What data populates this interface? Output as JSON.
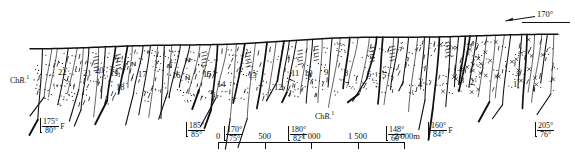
{
  "figure": {
    "type": "geological-cross-section",
    "title": "",
    "heading_annotation": {
      "label": "170°",
      "icon": "left-arrow-icon"
    },
    "formation_labels": [
      {
        "text_prefix": "Ch",
        "text_italic": "B",
        "text_suffix": ".",
        "superscript": "1",
        "x": 10,
        "y": 74
      },
      {
        "text_prefix": "Ch",
        "text_italic": "B",
        "text_suffix": ".",
        "superscript": "1",
        "x": 315,
        "y": 110
      }
    ],
    "unit_numbers": [
      {
        "label": "22",
        "x": 58,
        "y": 68
      },
      {
        "label": "21",
        "x": 83,
        "y": 69
      },
      {
        "label": "20",
        "x": 95,
        "y": 66
      },
      {
        "label": "19",
        "x": 110,
        "y": 69
      },
      {
        "label": "18",
        "x": 116,
        "y": 83
      },
      {
        "label": "17",
        "x": 138,
        "y": 70
      },
      {
        "label": "16",
        "x": 172,
        "y": 71
      },
      {
        "label": "15",
        "x": 203,
        "y": 70
      },
      {
        "label": "14",
        "x": 217,
        "y": 80
      },
      {
        "label": "13",
        "x": 248,
        "y": 71
      },
      {
        "label": "12",
        "x": 274,
        "y": 83
      },
      {
        "label": "11",
        "x": 291,
        "y": 69
      },
      {
        "label": "10",
        "x": 304,
        "y": 69
      },
      {
        "label": "9",
        "x": 324,
        "y": 68
      },
      {
        "label": "8",
        "x": 344,
        "y": 69
      },
      {
        "label": "7",
        "x": 345,
        "y": 81
      },
      {
        "label": "6",
        "x": 367,
        "y": 70
      },
      {
        "label": "5",
        "x": 382,
        "y": 71
      },
      {
        "label": "4",
        "x": 418,
        "y": 80
      },
      {
        "label": "3",
        "x": 460,
        "y": 76
      },
      {
        "label": "2",
        "x": 470,
        "y": 78
      },
      {
        "label": "1",
        "x": 513,
        "y": 80
      }
    ],
    "dip_symbols": [
      {
        "strike": "175°",
        "dip": "80°",
        "suffix": "F",
        "x": 40,
        "y": 118
      },
      {
        "strike": "185°",
        "dip": "85°",
        "suffix": "",
        "x": 186,
        "y": 122
      },
      {
        "strike": "170°",
        "dip": "75°",
        "suffix": "",
        "x": 224,
        "y": 126
      },
      {
        "strike": "180°",
        "dip": "82°",
        "suffix": "",
        "x": 288,
        "y": 126
      },
      {
        "strike": "148°",
        "dip": "60°",
        "suffix": "",
        "x": 386,
        "y": 126
      },
      {
        "strike": "160°",
        "dip": "84°",
        "suffix": "F",
        "x": 428,
        "y": 122
      },
      {
        "strike": "205°",
        "dip": "76°",
        "suffix": "",
        "x": 535,
        "y": 122
      }
    ],
    "scale_bar": {
      "unit": "m",
      "labels": [
        "0",
        "500",
        "1 000",
        "1 500",
        "2 000m"
      ],
      "values": [
        0,
        500,
        1000,
        1500,
        2000
      ],
      "x": 218,
      "y": 131,
      "width": 78
    }
  },
  "colors": {
    "ink": "#111111",
    "background": "#ffffff"
  }
}
